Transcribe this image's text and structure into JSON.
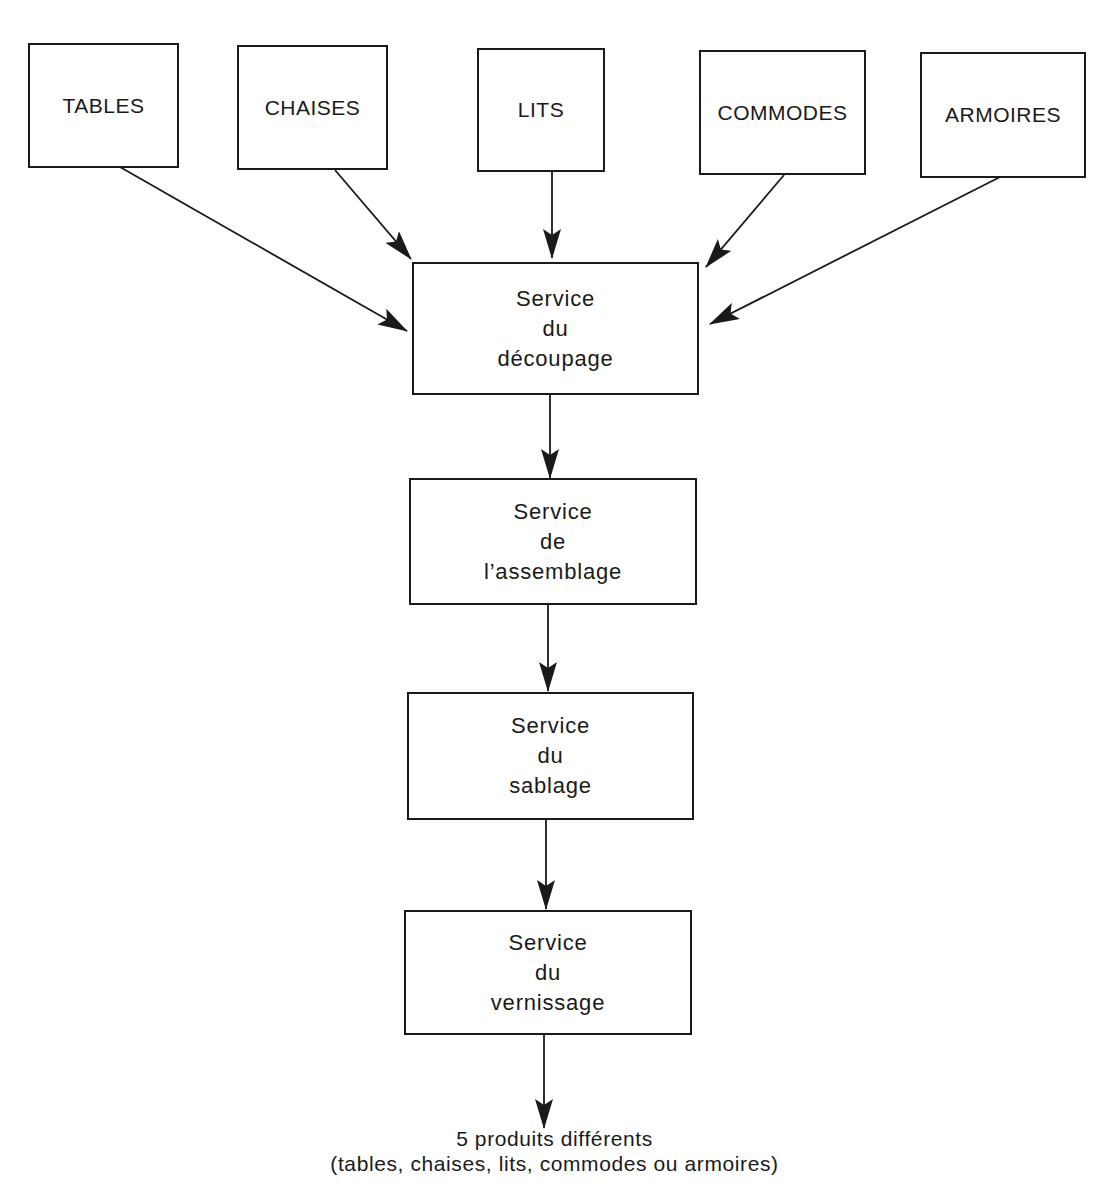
{
  "diagram": {
    "type": "flowchart",
    "direction": "top-to-bottom",
    "colors": {
      "stroke": "#1a1a1a",
      "background": "#ffffff"
    },
    "products": [
      {
        "id": "tables",
        "label": "TABLES"
      },
      {
        "id": "chaises",
        "label": "CHAISES"
      },
      {
        "id": "lits",
        "label": "LITS"
      },
      {
        "id": "commodes",
        "label": "COMMODES"
      },
      {
        "id": "armoires",
        "label": "ARMOIRES"
      }
    ],
    "services": [
      {
        "id": "decoupage",
        "line1": "Service",
        "line2": "du",
        "line3": "découpage"
      },
      {
        "id": "assemblage",
        "line1": "Service",
        "line2": "de",
        "line3": "l’assemblage"
      },
      {
        "id": "sablage",
        "line1": "Service",
        "line2": "du",
        "line3": "sablage"
      },
      {
        "id": "vernissage",
        "line1": "Service",
        "line2": "du",
        "line3": "vernissage"
      }
    ],
    "output": {
      "line1": "5 produits différents",
      "line2": "(tables, chaises, lits, commodes ou armoires)"
    },
    "edges": [
      {
        "from": "tables",
        "to": "decoupage"
      },
      {
        "from": "chaises",
        "to": "decoupage"
      },
      {
        "from": "lits",
        "to": "decoupage"
      },
      {
        "from": "commodes",
        "to": "decoupage"
      },
      {
        "from": "armoires",
        "to": "decoupage"
      },
      {
        "from": "decoupage",
        "to": "assemblage"
      },
      {
        "from": "assemblage",
        "to": "sablage"
      },
      {
        "from": "sablage",
        "to": "vernissage"
      },
      {
        "from": "vernissage",
        "to": "output"
      }
    ]
  }
}
